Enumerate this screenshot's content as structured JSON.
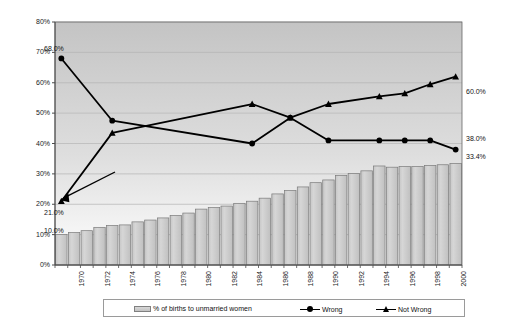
{
  "chart_data": {
    "type": "bar",
    "title": "",
    "xlabel": "",
    "ylabel": "",
    "ylim": [
      0,
      80
    ],
    "ytick_labels": [
      "0%",
      "10%",
      "20%",
      "30%",
      "40%",
      "50%",
      "60%",
      "70%",
      "80%"
    ],
    "ytick_values": [
      0,
      10,
      20,
      30,
      40,
      50,
      60,
      70,
      80
    ],
    "grid": true,
    "legend_position": "bottom",
    "x": [
      1969,
      1970,
      1971,
      1972,
      1973,
      1974,
      1975,
      1976,
      1977,
      1978,
      1979,
      1980,
      1981,
      1982,
      1983,
      1984,
      1985,
      1986,
      1987,
      1988,
      1989,
      1990,
      1991,
      1992,
      1993,
      1994,
      1995,
      1996,
      1997,
      1998,
      1999,
      2000
    ],
    "xtick_labels": [
      "1970",
      "1972",
      "1974",
      "1976",
      "1978",
      "1980",
      "1982",
      "1984",
      "1986",
      "1988",
      "1990",
      "1992",
      "1994",
      "1996",
      "1998",
      "2000"
    ],
    "xtick_values": [
      1970,
      1972,
      1974,
      1976,
      1978,
      1980,
      1982,
      1984,
      1986,
      1988,
      1990,
      1992,
      1994,
      1996,
      1998,
      2000
    ],
    "series": [
      {
        "name": "% of births to unmarried women",
        "type": "bar",
        "values": [
          10.0,
          10.7,
          11.3,
          12.4,
          13.0,
          13.2,
          14.2,
          14.8,
          15.5,
          16.3,
          17.1,
          18.4,
          18.9,
          19.4,
          20.3,
          21.0,
          22.0,
          23.4,
          24.5,
          25.7,
          27.1,
          28.0,
          29.5,
          30.1,
          31.0,
          32.6,
          32.2,
          32.4,
          32.4,
          32.8,
          33.0,
          33.4
        ],
        "color": "#cccccc",
        "data_labels": [
          {
            "x": 1969,
            "value": 10.0,
            "text": "10.0%"
          }
        ]
      },
      {
        "name": "Wrong",
        "type": "line",
        "marker": "circle",
        "color": "#000000",
        "points": [
          {
            "x": 1969,
            "y": 68.0
          },
          {
            "x": 1973,
            "y": 47.5
          },
          {
            "x": 1984,
            "y": 40.0
          },
          {
            "x": 1987,
            "y": 48.5
          },
          {
            "x": 1990,
            "y": 41.0
          },
          {
            "x": 1994,
            "y": 41.0
          },
          {
            "x": 1996,
            "y": 41.0
          },
          {
            "x": 1998,
            "y": 41.0
          },
          {
            "x": 2000,
            "y": 38.0
          }
        ],
        "data_labels": [
          {
            "x": 1969,
            "value": 68.0,
            "text": "68.0%"
          },
          {
            "x": 2000,
            "value": 38.0,
            "text": "38.0%"
          }
        ]
      },
      {
        "name": "Not Wrong",
        "type": "line",
        "marker": "triangle",
        "color": "#000000",
        "points": [
          {
            "x": 1969,
            "y": 21.0
          },
          {
            "x": 1973,
            "y": 43.5
          },
          {
            "x": 1984,
            "y": 53.0
          },
          {
            "x": 1987,
            "y": 48.5
          },
          {
            "x": 1990,
            "y": 53.0
          },
          {
            "x": 1994,
            "y": 55.5
          },
          {
            "x": 1996,
            "y": 56.5
          },
          {
            "x": 1998,
            "y": 59.5
          },
          {
            "x": 2000,
            "y": 62.0
          }
        ],
        "data_labels": [
          {
            "x": 1969,
            "value": 21.0,
            "text": "21.0%"
          },
          {
            "x": 2000,
            "value": 60.0,
            "text": "60.0%"
          }
        ]
      }
    ],
    "annotations": [
      {
        "text": "33.4%",
        "value": 33.4,
        "series": "% of births to unmarried women",
        "note": "final bar value label at right edge"
      }
    ]
  },
  "legend": {
    "entries": [
      {
        "label": "% of births to unmarried women",
        "symbol": "bar-swatch"
      },
      {
        "label": "Wrong",
        "symbol": "line-circle-marker"
      },
      {
        "label": "Not Wrong",
        "symbol": "line-triangle-marker"
      }
    ]
  },
  "labels": {
    "y_68": "68.0%",
    "y_21": "21.0%",
    "y_10": "10.0%",
    "y_60": "60.0%",
    "y_38": "38.0%",
    "y_334": "33.4%"
  },
  "colors": {
    "bar_fill": "#cccccc",
    "bar_stroke": "#7a7a7a",
    "line": "#000000",
    "plot_bg_top": "#c9c9c9",
    "plot_bg_bottom": "#ffffff",
    "grid": "#b4b4b4",
    "axis": "#666666",
    "text": "#141414"
  }
}
